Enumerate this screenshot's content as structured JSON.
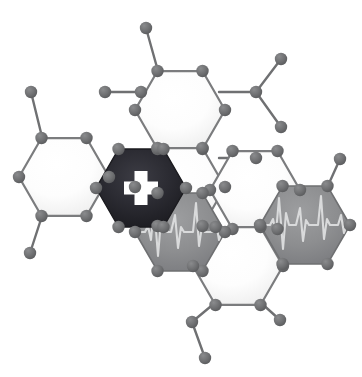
{
  "artwork": {
    "title": "Molecular Hexagon Medical Network Logo",
    "canvas": {
      "width": 362,
      "height": 377,
      "background": "#ffffff"
    },
    "palette": {
      "background": "#ffffff",
      "bond_stroke": "#6f7072",
      "node_fill": "#6f7072",
      "node_fill_dark": "#5e5f61",
      "hex_outline": "#7b7c7e",
      "hex_white_fill": "#fdfdfd",
      "hex_white_highlight": "#ffffff",
      "hex_white_shadow": "#e3e3e3",
      "hex_dark_fill": "#24242a",
      "hex_dark_highlight": "#3b3b42",
      "hex_dark_shadow": "#141417",
      "hex_gray_fill": "#8d8e90",
      "hex_gray_highlight": "#9b9c9e",
      "hex_gray_shadow": "#75767a",
      "cross_fill": "#ffffff",
      "ecg_stroke": "#d8d9da"
    },
    "geometry": {
      "hex_radius": 45,
      "node_radius": 6.2,
      "node_radius_small": 5.8,
      "bond_width": 2.4,
      "hex_outline_width": 2.2
    },
    "hexagons": [
      {
        "id": "hex-left-white",
        "name": "hexagon-left-plain",
        "cx": 64,
        "cy": 177,
        "style": "white",
        "symbol": "none",
        "label": "Plain hexagon (left)"
      },
      {
        "id": "hex-top-white",
        "name": "hexagon-top-plain",
        "cx": 180,
        "cy": 110,
        "style": "white",
        "symbol": "none",
        "label": "Plain hexagon (top center)"
      },
      {
        "id": "hex-cross-dark",
        "name": "hexagon-medical-cross",
        "cx": 141,
        "cy": 188,
        "style": "dark",
        "symbol": "cross",
        "label": "Dark hexagon with medical cross"
      },
      {
        "id": "hex-mid-white",
        "name": "hexagon-middle-plain",
        "cx": 180,
        "cy": 187,
        "style": "white",
        "symbol": "none",
        "label": "Plain hexagon (middle)"
      },
      {
        "id": "hex-right-upper-white",
        "name": "hexagon-right-upper-plain",
        "cx": 255,
        "cy": 190,
        "style": "white",
        "symbol": "none",
        "label": "Plain hexagon (right upper)"
      },
      {
        "id": "hex-ecg-left",
        "name": "hexagon-ecg-left",
        "cx": 180,
        "cy": 232,
        "style": "gray",
        "symbol": "ecg",
        "label": "Gray hexagon with ECG heartbeat line"
      },
      {
        "id": "hex-bottom-white",
        "name": "hexagon-bottom-plain",
        "cx": 238,
        "cy": 266,
        "style": "white",
        "symbol": "none",
        "label": "Plain hexagon (bottom)"
      },
      {
        "id": "hex-ecg-right",
        "name": "hexagon-ecg-right",
        "cx": 305,
        "cy": 225,
        "style": "gray",
        "symbol": "ecg",
        "label": "Gray hexagon with ECG heartbeat line"
      }
    ],
    "bonds": [
      {
        "name": "bond-left-top-out",
        "x1": 43,
        "y1": 141,
        "x2": 31,
        "y2": 92
      },
      {
        "name": "bond-left-bottom-out",
        "x1": 43,
        "y1": 213,
        "x2": 30,
        "y2": 253
      },
      {
        "name": "bond-topleft-link",
        "x1": 105,
        "y1": 145,
        "x2": 105,
        "y2": 145
      },
      {
        "name": "bond-hexrow-upper",
        "x1": 105,
        "y1": 92,
        "x2": 141,
        "y2": 92
      },
      {
        "name": "bond-top-stem",
        "x1": 158,
        "y1": 74,
        "x2": 146,
        "y2": 28
      },
      {
        "name": "bond-right-upper-link",
        "x1": 219,
        "y1": 92,
        "x2": 256,
        "y2": 92
      },
      {
        "name": "bond-branch-up",
        "x1": 256,
        "y1": 92,
        "x2": 281,
        "y2": 59
      },
      {
        "name": "bond-branch-down",
        "x1": 256,
        "y1": 92,
        "x2": 281,
        "y2": 127
      },
      {
        "name": "bond-right-mid-link",
        "x1": 219,
        "y1": 158,
        "x2": 256,
        "y2": 158
      },
      {
        "name": "bond-ecg-right-stem",
        "x1": 326,
        "y1": 190,
        "x2": 340,
        "y2": 159
      },
      {
        "name": "bond-bottom-left-1",
        "x1": 216,
        "y1": 302,
        "x2": 192,
        "y2": 322
      },
      {
        "name": "bond-bottom-left-2",
        "x1": 192,
        "y1": 322,
        "x2": 205,
        "y2": 358
      },
      {
        "name": "bond-bottom-right-1",
        "x1": 260,
        "y1": 302,
        "x2": 280,
        "y2": 320
      }
    ],
    "terminal_nodes": [
      {
        "name": "node-terminal-top-left",
        "cx": 31,
        "cy": 92
      },
      {
        "name": "node-terminal-bottom-left",
        "cx": 30,
        "cy": 253
      },
      {
        "name": "node-terminal-top",
        "cx": 146,
        "cy": 28
      },
      {
        "name": "node-branch-hub",
        "cx": 256,
        "cy": 92
      },
      {
        "name": "node-terminal-branch-up",
        "cx": 281,
        "cy": 59
      },
      {
        "name": "node-terminal-branch-down",
        "cx": 281,
        "cy": 127
      },
      {
        "name": "node-terminal-right-mid",
        "cx": 256,
        "cy": 158
      },
      {
        "name": "node-terminal-ecg-right",
        "cx": 340,
        "cy": 159
      },
      {
        "name": "node-chain-bottom-mid",
        "cx": 192,
        "cy": 322
      },
      {
        "name": "node-terminal-bottom-end",
        "cx": 205,
        "cy": 358
      },
      {
        "name": "node-terminal-bottom-right",
        "cx": 280,
        "cy": 320
      }
    ],
    "symbols": {
      "cross": {
        "name": "medical-cross-symbol",
        "description": "White Greek cross (plus sign) centered in dark hexagon",
        "arm_length": 34,
        "arm_thickness": 13,
        "color": "#ffffff"
      },
      "ecg": {
        "name": "ecg-heartbeat-symbol",
        "description": "Light gray electrocardiogram waveform spanning hexagon width",
        "color": "#d8d9da",
        "stroke_width": 2.1,
        "waveform_points": "0,0 4,0 7,-4 10,6 13,-20 16,22 19,-9 22,0 28,0 31,-14 34,16 37,-3 40,0 48,0 51,-22 54,18 57,-5 60,0 66,0 69,-8 72,6 75,0 82,0"
      }
    }
  }
}
